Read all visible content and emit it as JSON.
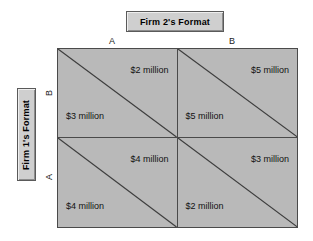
{
  "figure": {
    "type": "payoff-matrix",
    "column_player_label": "Firm 2's Format",
    "row_player_label": "Firm 1's Format",
    "column_headers": [
      "A",
      "B"
    ],
    "row_headers": [
      "B",
      "A"
    ],
    "colors": {
      "cell_fill": "#b9b9b9",
      "plate_fill": "#cfcfcf",
      "line": "#4a4a4a",
      "background": "#ffffff"
    },
    "cells": [
      {
        "id": "row-B-col-A",
        "row": "B",
        "column": "A",
        "upper_right_payoff": "$2 million",
        "lower_left_payoff": "$3 million"
      },
      {
        "id": "row-B-col-B",
        "row": "B",
        "column": "B",
        "upper_right_payoff": "$5 million",
        "lower_left_payoff": "$5 million"
      },
      {
        "id": "row-A-col-A",
        "row": "A",
        "column": "A",
        "upper_right_payoff": "$4 million",
        "lower_left_payoff": "$4 million"
      },
      {
        "id": "row-A-col-B",
        "row": "A",
        "column": "B",
        "upper_right_payoff": "$3 million",
        "lower_left_payoff": "$2 million"
      }
    ]
  }
}
